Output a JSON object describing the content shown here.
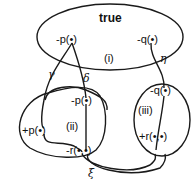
{
  "diagram": {
    "regions": [
      {
        "id": "i",
        "label": "(i)",
        "title": "true",
        "nodes": [
          "-p(•)",
          "-q(•)"
        ]
      },
      {
        "id": "ii",
        "label": "(ii)",
        "nodes": [
          "-p(•)",
          "+p(•)",
          "-r(•,•)"
        ]
      },
      {
        "id": "iii",
        "label": "(iii)",
        "nodes": [
          "-q(•)",
          "+r(•,•)"
        ]
      }
    ],
    "region_i": {
      "title": "true",
      "label": "(i)",
      "neg_p": "-p(•)",
      "neg_q": "-q(•)"
    },
    "region_ii": {
      "label": "(ii)",
      "neg_p": "-p(•)",
      "pos_p": "+p(•)",
      "neg_r": "-r(•,•)"
    },
    "region_iii": {
      "label": "(iii)",
      "neg_q": "-q(•)",
      "pos_r": "+r(•,•)"
    },
    "edges": {
      "gamma": "γ",
      "delta": "δ",
      "eta": "η",
      "xi": "ξ"
    },
    "colors": {
      "ink": "#1a1a1a",
      "background": "#ffffff"
    }
  }
}
